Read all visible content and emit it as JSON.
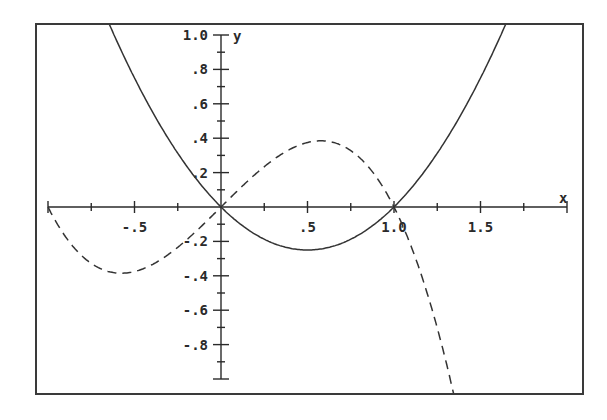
{
  "chart_data": {
    "type": "line",
    "title": "",
    "xlabel": "x",
    "ylabel": "y",
    "xlim": [
      -1.0,
      2.0
    ],
    "ylim": [
      -1.0,
      1.0
    ],
    "grid": false,
    "legend": null,
    "x_ticks": [
      {
        "value": -0.5,
        "label": "-.5"
      },
      {
        "value": 0.5,
        "label": ".5"
      },
      {
        "value": 1.0,
        "label": "1.0"
      },
      {
        "value": 1.5,
        "label": "1.5"
      }
    ],
    "x_minor_step": 0.25,
    "y_ticks": [
      {
        "value": 1.0,
        "label": "1.0"
      },
      {
        "value": 0.8,
        "label": ".8"
      },
      {
        "value": 0.6,
        "label": ".6"
      },
      {
        "value": 0.4,
        "label": ".4"
      },
      {
        "value": 0.2,
        "label": ".2"
      },
      {
        "value": -0.2,
        "label": "-.2"
      },
      {
        "value": -0.4,
        "label": "-.4"
      },
      {
        "value": -0.6,
        "label": "-.6"
      },
      {
        "value": -0.8,
        "label": "-.8"
      }
    ],
    "y_minor_step": 0.1,
    "series": [
      {
        "name": "y = x^2 - x",
        "style": "solid",
        "x": [
          -0.62,
          -0.5,
          -0.25,
          0,
          0.25,
          0.5,
          0.75,
          1.0,
          1.25,
          1.5,
          1.62
        ],
        "values": [
          1.0,
          0.75,
          0.3125,
          0,
          -0.1875,
          -0.25,
          -0.1875,
          0,
          0.3125,
          0.75,
          1.0
        ]
      },
      {
        "name": "y = x - x^3",
        "style": "dashed",
        "x": [
          -1.0,
          -0.75,
          -0.577,
          -0.5,
          -0.25,
          0,
          0.25,
          0.5,
          0.577,
          0.75,
          1.0,
          1.25,
          1.32
        ],
        "values": [
          0,
          -0.328,
          -0.385,
          -0.375,
          -0.234,
          0,
          0.234,
          0.375,
          0.385,
          0.328,
          0,
          -0.703,
          -0.98
        ]
      }
    ]
  },
  "axes": {
    "x_label": "x",
    "y_label": "y"
  }
}
